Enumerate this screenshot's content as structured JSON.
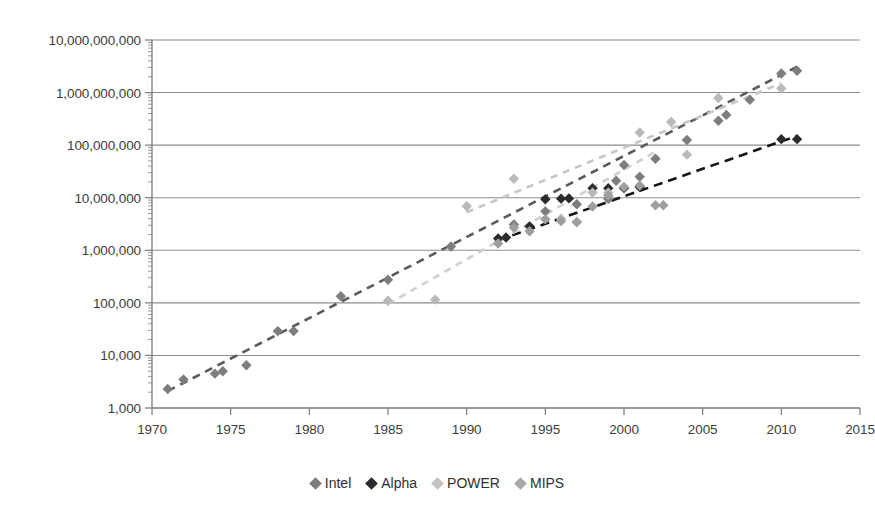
{
  "chart_data": {
    "type": "scatter",
    "title": "",
    "xlabel": "",
    "ylabel": "",
    "xlim": [
      1970,
      2015
    ],
    "ylim": [
      1000,
      10000000000
    ],
    "yscale": "log",
    "grid": "horizontal-major",
    "legend_position": "bottom",
    "x_ticks": [
      "1970",
      "1975",
      "1980",
      "1985",
      "1990",
      "1995",
      "2000",
      "2005",
      "2010",
      "2015"
    ],
    "x_tick_values": [
      1970,
      1975,
      1980,
      1985,
      1990,
      1995,
      2000,
      2005,
      2010,
      2015
    ],
    "y_ticks": [
      "1,000",
      "10,000",
      "100,000",
      "1,000,000",
      "10,000,000",
      "100,000,000",
      "1,000,000,000",
      "10,000,000,000"
    ],
    "y_tick_values": [
      1000,
      10000,
      100000,
      1000000,
      10000000,
      100000000,
      1000000000,
      10000000000
    ],
    "series": [
      {
        "name": "Intel",
        "color": "#7d7d7d",
        "trendline": {
          "color": "#5a5a5a",
          "x": [
            1971,
            2011
          ],
          "y": [
            2100,
            3100000000
          ],
          "dash": "8,6"
        },
        "points": [
          {
            "x": 1971,
            "y": 2300
          },
          {
            "x": 1972,
            "y": 3500
          },
          {
            "x": 1974,
            "y": 4500
          },
          {
            "x": 1974.5,
            "y": 5000
          },
          {
            "x": 1976,
            "y": 6500
          },
          {
            "x": 1978,
            "y": 29000
          },
          {
            "x": 1979,
            "y": 29000
          },
          {
            "x": 1982,
            "y": 134000
          },
          {
            "x": 1985,
            "y": 275000
          },
          {
            "x": 1989,
            "y": 1180000
          },
          {
            "x": 1993,
            "y": 3100000
          },
          {
            "x": 1995,
            "y": 5500000
          },
          {
            "x": 1997,
            "y": 7500000
          },
          {
            "x": 1999,
            "y": 9500000
          },
          {
            "x": 1999.5,
            "y": 21000000
          },
          {
            "x": 2000,
            "y": 42000000
          },
          {
            "x": 2001,
            "y": 25000000
          },
          {
            "x": 2002,
            "y": 55000000
          },
          {
            "x": 2004,
            "y": 125000000
          },
          {
            "x": 2006,
            "y": 291000000
          },
          {
            "x": 2006.5,
            "y": 376000000
          },
          {
            "x": 2008,
            "y": 731000000
          },
          {
            "x": 2010,
            "y": 2300000000
          },
          {
            "x": 2011,
            "y": 2600000000
          }
        ]
      },
      {
        "name": "Alpha",
        "color": "#2b2b2b",
        "trendline": {
          "color": "#141414",
          "x": [
            1992,
            2011
          ],
          "y": [
            1550000,
            150000000
          ],
          "dash": "9,6"
        },
        "points": [
          {
            "x": 1992,
            "y": 1680000
          },
          {
            "x": 1992.5,
            "y": 1750000
          },
          {
            "x": 1994,
            "y": 2850000
          },
          {
            "x": 1995,
            "y": 9300000
          },
          {
            "x": 1996,
            "y": 9600000
          },
          {
            "x": 1996.5,
            "y": 9700000
          },
          {
            "x": 1998,
            "y": 15200000
          },
          {
            "x": 1999,
            "y": 15200000
          },
          {
            "x": 2000,
            "y": 15200000
          },
          {
            "x": 2001,
            "y": 16000000
          },
          {
            "x": 2010,
            "y": 130000000
          },
          {
            "x": 2011,
            "y": 130000000
          }
        ]
      },
      {
        "name": "POWER",
        "color": "#b9b9b9",
        "trendline": {
          "color": "#c6c6c6",
          "x": [
            1990,
            2010
          ],
          "y": [
            5300000,
            1500000000
          ],
          "dash": "7,6"
        },
        "points": [
          {
            "x": 1985,
            "y": 110000
          },
          {
            "x": 1988,
            "y": 115000
          },
          {
            "x": 1990,
            "y": 6900000
          },
          {
            "x": 1993,
            "y": 23000000
          },
          {
            "x": 1996,
            "y": 4000000
          },
          {
            "x": 1997,
            "y": 3500000
          },
          {
            "x": 1998,
            "y": 12500000
          },
          {
            "x": 1999,
            "y": 12500000
          },
          {
            "x": 2001,
            "y": 174000000
          },
          {
            "x": 2003,
            "y": 276000000
          },
          {
            "x": 2004,
            "y": 66000000
          },
          {
            "x": 2006,
            "y": 790000000
          },
          {
            "x": 2010,
            "y": 1200000000
          }
        ]
      },
      {
        "name": "MIPS",
        "color": "#9e9e9e",
        "trendline": {
          "color": "#cfcfcf",
          "x": [
            1985,
            2002
          ],
          "y": [
            95000,
            75000000
          ],
          "dash": "7,6"
        },
        "points": [
          {
            "x": 1992,
            "y": 1350000
          },
          {
            "x": 1993,
            "y": 2700000
          },
          {
            "x": 1994,
            "y": 2300000
          },
          {
            "x": 1995,
            "y": 3900000
          },
          {
            "x": 1996,
            "y": 3600000
          },
          {
            "x": 1997,
            "y": 3400000
          },
          {
            "x": 1998,
            "y": 6800000
          },
          {
            "x": 1999,
            "y": 11000000
          },
          {
            "x": 2000,
            "y": 16000000
          },
          {
            "x": 2001,
            "y": 17000000
          },
          {
            "x": 2002,
            "y": 7200000
          },
          {
            "x": 2002.5,
            "y": 7200000
          }
        ]
      }
    ]
  },
  "legend": {
    "items": [
      {
        "label": "Intel",
        "color": "#7d7d7d"
      },
      {
        "label": "Alpha",
        "color": "#2b2b2b"
      },
      {
        "label": "POWER",
        "color": "#c2c2c2"
      },
      {
        "label": "MIPS",
        "color": "#a8a8a8"
      }
    ]
  },
  "axes": {
    "grid_color": "#8c8c8c",
    "axis_color": "#7a7a7a",
    "tick_color": "#9a9a9a",
    "label_color": "#3d3d3d"
  }
}
